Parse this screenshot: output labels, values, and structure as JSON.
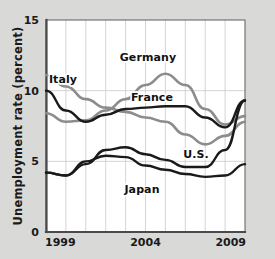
{
  "chart_data": {
    "type": "line",
    "title": "",
    "xlabel": "",
    "ylabel": "Unemployment rate (percent)",
    "xlim": [
      1999,
      2009
    ],
    "ylim": [
      0,
      15
    ],
    "yticks": [
      0,
      5,
      10,
      15
    ],
    "ytick_labels": [
      "0",
      "5",
      "10",
      "15"
    ],
    "xticks": [
      1999,
      2004,
      2009
    ],
    "xtick_labels": [
      "1999",
      "2004",
      "2009"
    ],
    "x": [
      1999,
      2000,
      2001,
      2002,
      2003,
      2004,
      2005,
      2006,
      2007,
      2008,
      2009
    ],
    "grid": "vertical gridlines at every year; faint horizontal gridlines at 5 and 10",
    "legend_position": "inline labels on plot",
    "series": [
      {
        "name": "Italy",
        "color": "#8c8c8c",
        "values": [
          11.1,
          10.3,
          9.4,
          8.8,
          8.5,
          8.1,
          7.8,
          6.9,
          6.2,
          6.8,
          7.8
        ]
      },
      {
        "name": "Germany",
        "color": "#8c8c8c",
        "values": [
          8.4,
          7.8,
          7.9,
          8.6,
          9.4,
          10.4,
          11.2,
          10.4,
          8.7,
          7.6,
          8.2
        ]
      },
      {
        "name": "France",
        "color": "#1a1a1a",
        "values": [
          10.0,
          8.6,
          7.8,
          8.3,
          8.7,
          8.8,
          8.9,
          8.9,
          8.1,
          7.4,
          9.3
        ]
      },
      {
        "name": "U.S.",
        "color": "#1a1a1a",
        "values": [
          4.2,
          4.0,
          4.8,
          5.8,
          6.0,
          5.5,
          5.1,
          4.6,
          4.6,
          5.8,
          9.3
        ]
      },
      {
        "name": "Japan",
        "color": "#1a1a1a",
        "values": [
          4.2,
          4.0,
          5.0,
          5.4,
          5.3,
          4.7,
          4.4,
          4.1,
          3.9,
          4.0,
          4.8
        ]
      }
    ],
    "annotations": [
      {
        "text": "Italy",
        "x_px": 63,
        "y_px": 83,
        "name": "series-label-italy"
      },
      {
        "text": "Germany",
        "x_px": 148,
        "y_px": 61,
        "name": "series-label-germany"
      },
      {
        "text": "France",
        "x_px": 152,
        "y_px": 101,
        "name": "series-label-france"
      },
      {
        "text": "U.S.",
        "x_px": 196,
        "y_px": 158,
        "name": "series-label-us"
      },
      {
        "text": "Japan",
        "x_px": 142,
        "y_px": 193,
        "name": "series-label-japan"
      }
    ]
  }
}
